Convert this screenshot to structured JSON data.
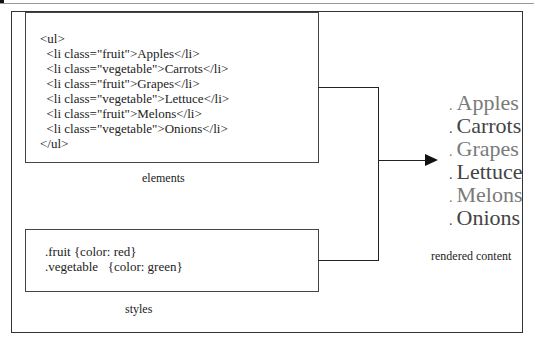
{
  "diagram": {
    "elements_box": {
      "caption": "elements",
      "lines": [
        "<ul>",
        "  <li class=\"fruit\">Apples</li>",
        "  <li class=\"vegetable\">Carrots</li>",
        "  <li class=\"fruit\">Grapes</li>",
        "  <li class=\"vegetable\">Lettuce</li>",
        "  <li class=\"fruit\">Melons</li>",
        "  <li class=\"vegetable\">Onions</li>",
        "</ul>"
      ]
    },
    "styles_box": {
      "caption": "styles",
      "lines": [
        ".fruit {color: red}",
        ".vegetable   {color: green}"
      ]
    },
    "rendered": {
      "caption": "rendered content",
      "bullet": ".",
      "items": [
        {
          "label": "Apples",
          "class": "fruit"
        },
        {
          "label": "Carrots",
          "class": "vegetable"
        },
        {
          "label": "Grapes",
          "class": "fruit"
        },
        {
          "label": "Lettuce",
          "class": "vegetable"
        },
        {
          "label": "Melons",
          "class": "fruit"
        },
        {
          "label": "Onions",
          "class": "vegetable"
        }
      ]
    },
    "colors": {
      "fruit_rendered": "#7a7a7a",
      "vegetable_rendered": "#444444",
      "line": "#222222"
    }
  }
}
